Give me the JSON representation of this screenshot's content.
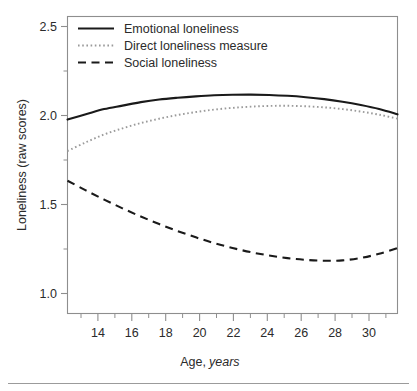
{
  "figure": {
    "background_color": "#ffffff",
    "frame_color": "#8e8e8e",
    "caption_rule": true
  },
  "chart_data": {
    "type": "line",
    "title": "",
    "xlabel_plain": "Age,",
    "xlabel_italic": "years",
    "xlabel": "Age, years",
    "ylabel": "Loneliness (raw scores)",
    "xlim": [
      13,
      31
    ],
    "ylim": [
      0.92,
      2.62
    ],
    "grid": false,
    "legend_position": "top-left-inside",
    "xticks": [
      14,
      16,
      18,
      20,
      22,
      24,
      26,
      28,
      30
    ],
    "xtick_labels": [
      "14",
      "16",
      "18",
      "20",
      "22",
      "24",
      "26",
      "28",
      "30"
    ],
    "xticks_minor": [
      13,
      15,
      17,
      19,
      21,
      23,
      25,
      27,
      29,
      31
    ],
    "yticks": [
      1.0,
      1.5,
      2.0,
      2.5
    ],
    "ytick_labels": [
      "1.0",
      "1.5",
      "2.0",
      "2.5"
    ],
    "yticks_minor": [
      1.25,
      1.75,
      2.25
    ],
    "x": [
      13,
      14,
      15,
      16,
      17,
      18,
      19,
      20,
      21,
      22,
      23,
      24,
      25,
      26,
      27,
      28,
      29,
      30,
      31
    ],
    "series": [
      {
        "name": "Emotional loneliness",
        "style": "solid",
        "color": "#1a1a1a",
        "values": [
          2.03,
          2.06,
          2.09,
          2.11,
          2.13,
          2.145,
          2.155,
          2.163,
          2.169,
          2.172,
          2.173,
          2.171,
          2.166,
          2.158,
          2.147,
          2.132,
          2.113,
          2.09,
          2.06
        ]
      },
      {
        "name": "Direct loneliness measure",
        "style": "dotted",
        "color": "#9a9a9a",
        "values": [
          1.85,
          1.9,
          1.945,
          1.98,
          2.01,
          2.035,
          2.056,
          2.073,
          2.087,
          2.097,
          2.104,
          2.108,
          2.109,
          2.106,
          2.1,
          2.09,
          2.076,
          2.058,
          2.035
        ]
      },
      {
        "name": "Social loneliness",
        "style": "dashed",
        "color": "#1a1a1a",
        "values": [
          1.68,
          1.625,
          1.572,
          1.522,
          1.475,
          1.432,
          1.392,
          1.356,
          1.323,
          1.295,
          1.271,
          1.252,
          1.237,
          1.227,
          1.222,
          1.224,
          1.238,
          1.262,
          1.295
        ]
      }
    ]
  },
  "legend": {
    "items": [
      {
        "label": "Emotional loneliness",
        "style": "solid"
      },
      {
        "label": "Direct loneliness measure",
        "style": "dotted"
      },
      {
        "label": "Social loneliness",
        "style": "dashed"
      }
    ]
  }
}
